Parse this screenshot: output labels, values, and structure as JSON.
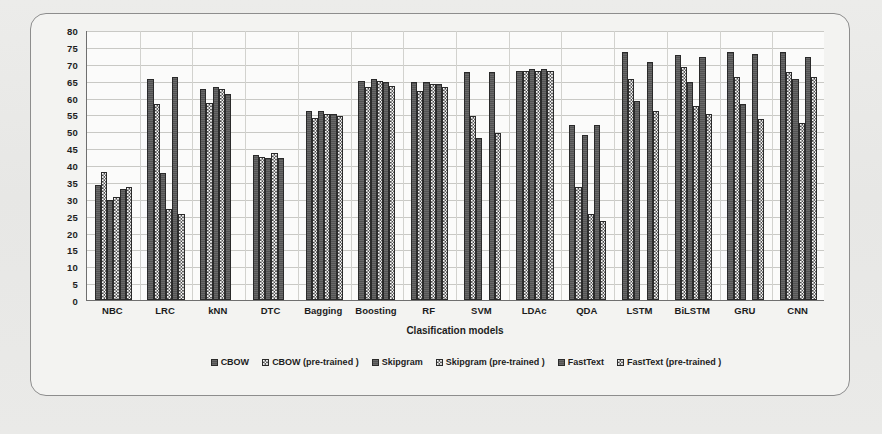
{
  "chart_data": {
    "type": "bar",
    "title": "",
    "xlabel": "Clasification models",
    "ylabel": "",
    "ylim": [
      0,
      80
    ],
    "ytick_step": 5,
    "grid": true,
    "legend_position": "bottom",
    "yticks": [
      80,
      75,
      70,
      65,
      60,
      55,
      50,
      45,
      40,
      35,
      30,
      25,
      20,
      15,
      10,
      5,
      0
    ],
    "categories": [
      "NBC",
      "LRC",
      "kNN",
      "DTC",
      "Bagging",
      "Boosting",
      "RF",
      "SVM",
      "LDAc",
      "QDA",
      "LSTM",
      "BiLSTM",
      "GRU",
      "CNN"
    ],
    "series": [
      {
        "name": "CBOW",
        "fill": "solid",
        "values": [
          34,
          65.5,
          62.5,
          43,
          56,
          65,
          64.5,
          67.5,
          68,
          52,
          73.5,
          72.5,
          73.5,
          73.5
        ]
      },
      {
        "name": "CBOW (pre-trained )",
        "fill": "check",
        "values": [
          38,
          58,
          58.5,
          42.5,
          54,
          63,
          62,
          54.5,
          68,
          33.5,
          65.5,
          69,
          66,
          67.5
        ]
      },
      {
        "name": "Skipgram",
        "fill": "solid",
        "values": [
          29.5,
          37.5,
          63,
          42,
          56,
          65.5,
          64.5,
          48,
          68.5,
          49,
          59,
          64.5,
          58,
          65.5
        ]
      },
      {
        "name": "Skipgram (pre-trained )",
        "fill": "check",
        "values": [
          30.5,
          27,
          62.5,
          43.5,
          55,
          65,
          64,
          0,
          68,
          25.5,
          0,
          57.5,
          0,
          52.5
        ]
      },
      {
        "name": "FastText",
        "fill": "solid",
        "values": [
          33,
          66,
          61,
          42,
          55,
          64.5,
          64,
          67.5,
          68.5,
          52,
          70.5,
          72,
          73,
          72
        ]
      },
      {
        "name": "FastText (pre-trained )",
        "fill": "check",
        "values": [
          33.5,
          25.5,
          0,
          0,
          54.5,
          63.5,
          63,
          49.5,
          68,
          23.5,
          56,
          55,
          53.5,
          66
        ]
      }
    ]
  },
  "colors": {
    "solid_series": "#585858",
    "check_series": "#ffffff",
    "bar_outline": "#2a2a2a",
    "gridline": "#c9c9c5",
    "axis": "#6f6f6f",
    "frame_border": "#8d8d8d",
    "page_background": "#e9e9e7",
    "plot_background": "#fbfbfa"
  }
}
